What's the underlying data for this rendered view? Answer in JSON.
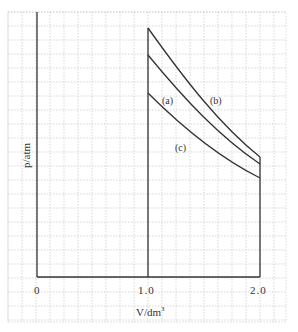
{
  "chart_data": {
    "type": "line",
    "title": "",
    "xlabel": "V/dm³",
    "ylabel": "p/atm",
    "xlim": [
      0,
      2.0
    ],
    "ylim": [
      0,
      1
    ],
    "grid": true,
    "x_ticks": [
      "0",
      "1.0",
      "2.0"
    ],
    "y_ticks": [],
    "legend": null,
    "series": [
      {
        "name": "(b)",
        "x": [
          1.0,
          1.25,
          1.5,
          1.75,
          2.0
        ],
        "y": [
          0.98,
          0.78,
          0.65,
          0.56,
          0.49
        ]
      },
      {
        "name": "(a)",
        "x": [
          1.0,
          1.25,
          1.5,
          1.75,
          2.0
        ],
        "y": [
          0.88,
          0.71,
          0.59,
          0.51,
          0.44
        ]
      },
      {
        "name": "(c)",
        "x": [
          1.0,
          1.25,
          1.5,
          1.75,
          2.0
        ],
        "y": [
          0.74,
          0.59,
          0.49,
          0.42,
          0.37
        ]
      }
    ],
    "annotations": [
      "(a)",
      "(b)",
      "(c)"
    ],
    "vertical_lines": [
      {
        "x": 0,
        "label": "p-axis"
      },
      {
        "x": 1.0,
        "label": "initial volume"
      },
      {
        "x": 2.0,
        "label": "final volume"
      }
    ]
  },
  "labels": {
    "x_axis": "V/dm",
    "x_axis_sup": "3",
    "y_axis": "p/atm",
    "tick_0": "0",
    "tick_1": "1.0",
    "tick_2": "2.0",
    "curve_a": "(a)",
    "curve_b": "(b)",
    "curve_c": "(c)"
  },
  "colors": {
    "line": "#333333",
    "grid": "#b8b8b8"
  }
}
